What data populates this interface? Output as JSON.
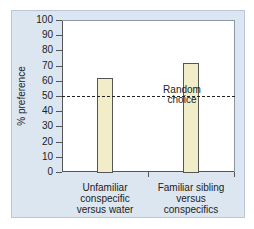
{
  "chart_data": {
    "type": "bar",
    "title": "",
    "xlabel": "",
    "ylabel": "% preference",
    "ylim": [
      0,
      100
    ],
    "yticks": [
      0,
      10,
      20,
      30,
      40,
      50,
      60,
      70,
      80,
      90,
      100
    ],
    "categories": [
      "Unfamiliar conspecific versus water",
      "Familiar sibling versus conspecifics"
    ],
    "category_lines": [
      [
        "Unfamiliar",
        "conspecific",
        "versus water"
      ],
      [
        "Familiar sibling",
        "versus",
        "conspecifics"
      ]
    ],
    "values": [
      62,
      72
    ],
    "reference_line": {
      "value": 50,
      "style": "dashed",
      "label": "Random choice",
      "label_lines": [
        "Random",
        "choice"
      ]
    },
    "grid": false,
    "legend": null,
    "colors": {
      "bar_fill": "#f0edc8",
      "bar_edge": "#555555",
      "panel_bg": "#dce6f0",
      "plot_bg": "#ffffff"
    }
  },
  "axis": {
    "ylabel": "% preference",
    "ticks": [
      "0",
      "10",
      "20",
      "30",
      "40",
      "50",
      "60",
      "70",
      "80",
      "90",
      "100"
    ]
  },
  "annotation": {
    "line1": "Random",
    "line2": "choice"
  },
  "xlabels": [
    {
      "l1": "Unfamiliar",
      "l2": "conspecific",
      "l3": "versus water"
    },
    {
      "l1": "Familiar sibling",
      "l2": "versus",
      "l3": "conspecifics"
    }
  ]
}
